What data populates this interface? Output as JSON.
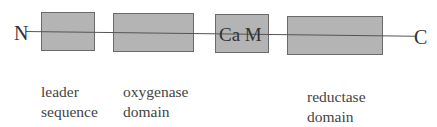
{
  "diagram": {
    "n_terminus": "N",
    "c_terminus": "C",
    "boxes": [
      {
        "id": "leader",
        "label": ""
      },
      {
        "id": "oxygenase",
        "label": ""
      },
      {
        "id": "cam",
        "label": "Ca M"
      },
      {
        "id": "reductase",
        "label": ""
      }
    ],
    "labels": {
      "leader": {
        "line1": "leader",
        "line2": "sequence"
      },
      "oxygenase": {
        "line1": "oxygenase",
        "line2": "domain"
      },
      "reductase": {
        "line1": "reductase",
        "line2": "domain"
      }
    },
    "colors": {
      "box_fill": "#b4b4b4",
      "box_border": "#6a6a6a",
      "line": "#555555"
    }
  }
}
